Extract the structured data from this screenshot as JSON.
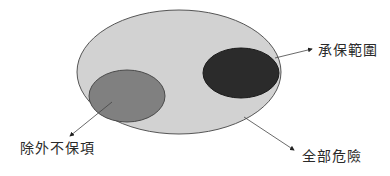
{
  "diagram": {
    "type": "venn-like nested ellipses",
    "shapes": [
      {
        "id": "all-risks",
        "label": "全部危險",
        "fill": "#d2d2d2",
        "stroke": "#555555"
      },
      {
        "id": "coverage-scope",
        "label": "承保範圍",
        "fill": "#2a2a2a",
        "stroke": "#1a1a1a"
      },
      {
        "id": "exclusions",
        "label": "除外不保項",
        "fill": "#7f7f7f",
        "stroke": "#4a4a4a"
      }
    ],
    "labels": {
      "coverage": "承保範圍",
      "exclusions": "除外不保項",
      "all_risks": "全部危險"
    }
  }
}
